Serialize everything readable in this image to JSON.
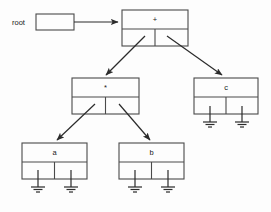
{
  "diagram": {
    "background_color": "#fdfdfd",
    "line_color": "#4a4a4a",
    "arrow_color": "#2b2b2b",
    "text_color": "#1a1a1a",
    "root_pointer": {
      "label": "root",
      "box_value": "",
      "points_to": "+"
    },
    "nodes": [
      {
        "id": "plus",
        "label": "+",
        "x": 122,
        "y": 10,
        "w": 66,
        "h": 36,
        "left_child": "star",
        "right_child": "c",
        "left_null": false,
        "right_null": false
      },
      {
        "id": "star",
        "label": "*",
        "x": 72,
        "y": 78,
        "w": 67,
        "h": 36,
        "left_child": "a",
        "right_child": "b",
        "left_null": false,
        "right_null": false
      },
      {
        "id": "c",
        "label": "c",
        "x": 194,
        "y": 78,
        "w": 64,
        "h": 36,
        "left_child": null,
        "right_child": null,
        "left_null": true,
        "right_null": true
      },
      {
        "id": "a",
        "label": "a",
        "x": 22,
        "y": 143,
        "w": 65,
        "h": 36,
        "left_child": null,
        "right_child": null,
        "left_null": true,
        "right_null": true
      },
      {
        "id": "b",
        "label": "b",
        "x": 119,
        "y": 143,
        "w": 65,
        "h": 36,
        "left_child": null,
        "right_child": null,
        "left_null": true,
        "right_null": true
      }
    ],
    "edges": [
      {
        "from": "plus",
        "to": "star",
        "side": "left"
      },
      {
        "from": "plus",
        "to": "c",
        "side": "right"
      },
      {
        "from": "star",
        "to": "a",
        "side": "left"
      },
      {
        "from": "star",
        "to": "b",
        "side": "right"
      }
    ],
    "ground_symbol": {
      "name": "null-pointer-ground",
      "stem_length": 14,
      "bars": 3
    }
  }
}
